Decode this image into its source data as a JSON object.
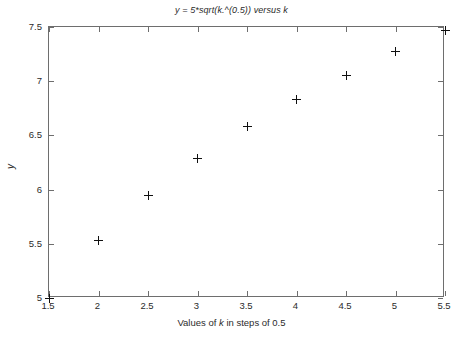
{
  "chart_data": {
    "type": "scatter",
    "title": "y = 5*sqrt(k.^(0.5)) versus k",
    "xlabel": "Values of k in steps of 0.5",
    "ylabel": "y",
    "xlim": [
      1.5,
      5.5
    ],
    "ylim": [
      5,
      7.5
    ],
    "xticks": [
      1.5,
      2,
      2.5,
      3,
      3.5,
      4,
      4.5,
      5,
      5.5
    ],
    "xtick_labels": [
      "1.5",
      "2",
      "2.5",
      "3",
      "3.5",
      "4",
      "4.5",
      "5",
      "5.5"
    ],
    "yticks": [
      5,
      5.5,
      6,
      6.5,
      7,
      7.5
    ],
    "ytick_labels": [
      "5",
      "5.5",
      "6",
      "6.5",
      "7",
      "7.5"
    ],
    "grid": false,
    "legend": null,
    "marker": "plus",
    "marker_color": "#101010",
    "axis_color": "#6e6e6e",
    "background": "#ffffff",
    "x": [
      1.5,
      2,
      2.5,
      3,
      3.5,
      4,
      4.5,
      5,
      5.5
    ],
    "y": [
      5.0,
      5.53,
      5.95,
      6.29,
      6.58,
      6.83,
      7.05,
      7.27,
      7.47
    ],
    "points": [
      {
        "x": 1.5,
        "y": 5.0
      },
      {
        "x": 2.0,
        "y": 5.53
      },
      {
        "x": 2.5,
        "y": 5.95
      },
      {
        "x": 3.0,
        "y": 6.29
      },
      {
        "x": 3.5,
        "y": 6.58
      },
      {
        "x": 4.0,
        "y": 6.83
      },
      {
        "x": 4.5,
        "y": 7.05
      },
      {
        "x": 5.0,
        "y": 7.27
      },
      {
        "x": 5.5,
        "y": 7.47
      }
    ]
  },
  "figure": {
    "title": "y = 5*sqrt(k.^(0.5)) versus k",
    "x_axis_label_prefix": "Values of ",
    "x_axis_label_var": "k",
    "x_axis_label_suffix": " in steps of 0.5",
    "y_axis_label": "y"
  }
}
